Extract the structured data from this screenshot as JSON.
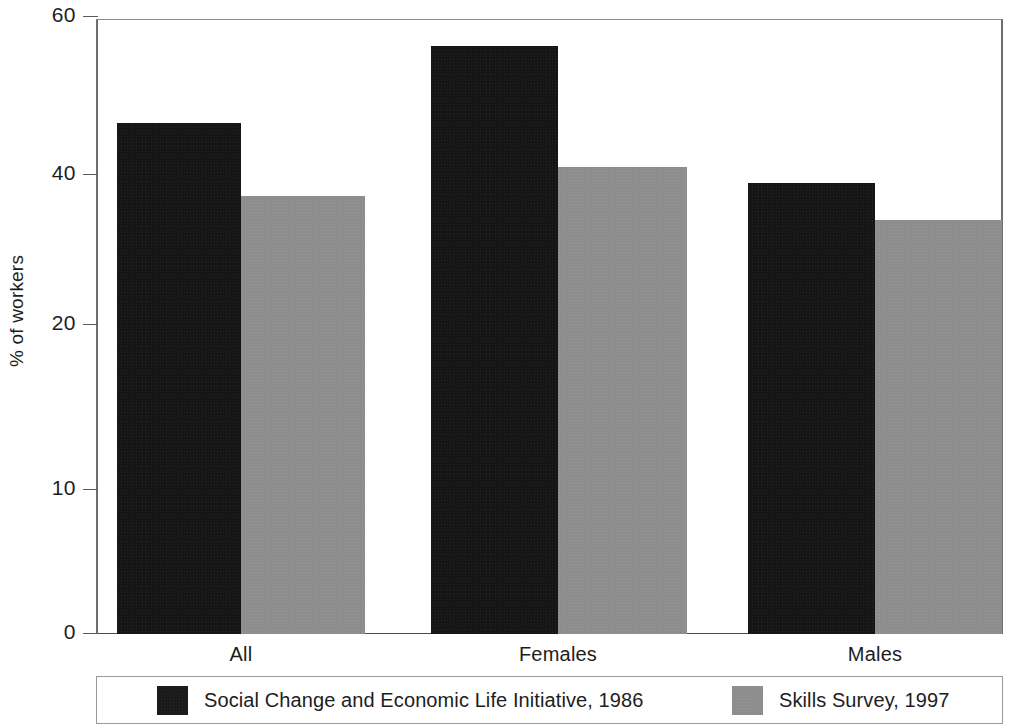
{
  "chart_data": {
    "type": "bar",
    "title": "",
    "xlabel": "",
    "ylabel": "% of workers",
    "categories": [
      "All",
      "Females",
      "Males"
    ],
    "series": [
      {
        "name": "Social Change and Economic Life Initiative, 1986",
        "color": "#1a1a1a",
        "values": [
          46,
          56.5,
          39
        ]
      },
      {
        "name": "Skills Survey, 1997",
        "color": "#8d8d8d",
        "values": [
          37.5,
          40.5,
          34
        ]
      }
    ],
    "ylim": [
      0,
      60
    ],
    "y_ticks": [
      0,
      10,
      20,
      40,
      60
    ],
    "y_tick_labels": [
      "0",
      "10",
      "20",
      "40",
      "60"
    ],
    "y_tick_positions_px": [
      634,
      490,
      325,
      175,
      17
    ],
    "grid": false,
    "legend_position": "bottom"
  },
  "axes": {
    "y_title": "% of workers",
    "ticks": [
      {
        "label": "60",
        "value": 60,
        "y": 17
      },
      {
        "label": "40",
        "value": 40,
        "y": 175
      },
      {
        "label": "20",
        "value": 20,
        "y": 325
      },
      {
        "label": "10",
        "value": 10,
        "y": 490
      },
      {
        "label": "0",
        "value": 0,
        "y": 634
      }
    ]
  },
  "groups": [
    {
      "label": "All",
      "center_x": 241,
      "bars": [
        {
          "series": "Social Change and Economic Life Initiative, 1986",
          "value": 46,
          "left": 117,
          "width": 124,
          "top": 123,
          "style": "dark"
        },
        {
          "series": "Skills Survey, 1997",
          "value": 37.5,
          "left": 241,
          "width": 124,
          "top": 196,
          "style": "light"
        }
      ]
    },
    {
      "label": "Females",
      "center_x": 558,
      "bars": [
        {
          "series": "Social Change and Economic Life Initiative, 1986",
          "value": 56.5,
          "left": 431,
          "width": 127,
          "top": 46,
          "style": "dark"
        },
        {
          "series": "Skills Survey, 1997",
          "value": 40.5,
          "left": 558,
          "width": 129,
          "top": 167,
          "style": "light"
        }
      ]
    },
    {
      "label": "Males",
      "center_x": 875,
      "bars": [
        {
          "series": "Social Change and Economic Life Initiative, 1986",
          "value": 39,
          "left": 748,
          "width": 127,
          "top": 183,
          "style": "dark"
        },
        {
          "series": "Skills Survey, 1997",
          "value": 34,
          "left": 875,
          "width": 127,
          "top": 220,
          "style": "light"
        }
      ]
    }
  ],
  "legend": {
    "entries": [
      {
        "label": "Social Change and Economic Life Initiative, 1986",
        "style": "dark",
        "left": 60
      },
      {
        "label": "Skills Survey, 1997",
        "style": "light",
        "left": 635
      }
    ]
  }
}
